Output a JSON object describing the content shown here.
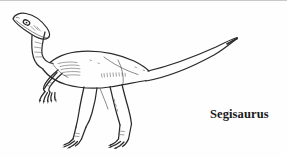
{
  "plate": {
    "background_color": "#fefefe",
    "ink_color": "#2b2b2b",
    "width": 287,
    "height": 158,
    "rule_color": "#c9c9c9"
  },
  "illustration": {
    "subject_name": "dinosaur-line-drawing",
    "style": "black-and-white ink line art",
    "parts": [
      "head",
      "eye",
      "jaw",
      "neck",
      "torso",
      "left-arm",
      "right-arm",
      "hand-claws",
      "left-leg",
      "right-leg",
      "feet-claws",
      "tail"
    ]
  },
  "caption": {
    "species": "Segisaurus",
    "color": "#1a1a1a"
  }
}
